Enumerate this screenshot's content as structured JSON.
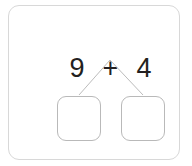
{
  "card": {
    "name": "number-bond-worksheet-card",
    "border_color": "#d8d8d8",
    "background_color": "#ffffff"
  },
  "problem": {
    "type": "number-bond-decomposition",
    "expression": "9 + 4",
    "first_addend": "9",
    "operator": "+",
    "second_addend": "4",
    "text_color": "#231f20"
  },
  "connector": {
    "shape": "inverted-v",
    "stroke_color": "#bcbcbc",
    "apex": {
      "x": 110,
      "y": 60
    },
    "left_end": {
      "x": 79,
      "y": 95
    },
    "right_end": {
      "x": 143,
      "y": 95
    }
  },
  "answer_boxes": [
    {
      "label": "",
      "placeholder": "",
      "position": "left"
    },
    {
      "label": "",
      "placeholder": "",
      "position": "right"
    }
  ]
}
